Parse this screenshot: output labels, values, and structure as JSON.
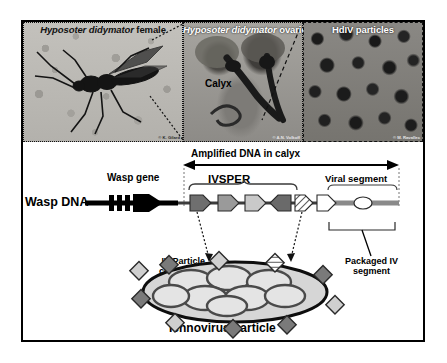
{
  "figure": {
    "panels": [
      {
        "id": "wasp",
        "title_italic": "Hyposoter didymator",
        "title_rest": " female",
        "credit": "© K. Gilard"
      },
      {
        "id": "ovaries",
        "title_italic": "Hyposoter didymator",
        "title_rest": " ovaries",
        "credit": "© A.N. Volkoff",
        "inner_label": "Calyx"
      },
      {
        "id": "hdiv",
        "title_italic": "",
        "title_rest": "HdIV particles",
        "credit": "© M. Ravallec"
      }
    ]
  },
  "diagram": {
    "wasp_dna_label": "Wasp DNA",
    "wasp_gene_label": "Wasp gene",
    "amplified_label": "Amplified DNA in calyx",
    "ivsper_label": "IVSPER",
    "viral_segment_label": "Viral segment",
    "iv_particle_component_line1": "IV Particle",
    "iv_particle_component_line2": "component",
    "packaged_line1": "Packaged IV",
    "packaged_line2": "segment",
    "particle_label": "Ichnovirus particle"
  },
  "colors": {
    "frame": "#000000",
    "dna_line": "#000000",
    "gene_dark": "#6f6f6f",
    "gene_mid": "#9a9a9a",
    "gene_light": "#c9c9c9",
    "gene_white": "#ffffff",
    "segment_bar": "#8a8a8a",
    "particle_fill": "#d6d6d6"
  }
}
